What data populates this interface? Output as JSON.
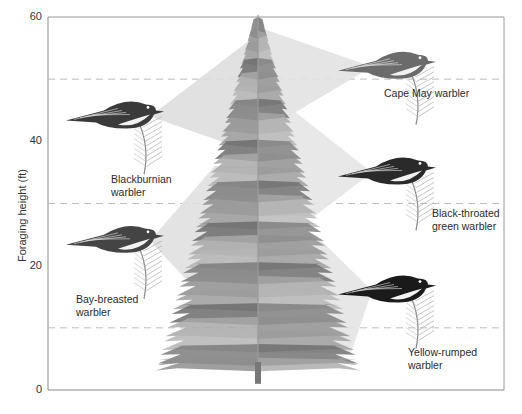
{
  "chart_data": {
    "type": "diagram",
    "title": "",
    "ylabel": "Foraging height (ft)",
    "ylim": [
      0,
      60
    ],
    "yticks": [
      0,
      20,
      40,
      60
    ],
    "gridlines_dashed": [
      10,
      30,
      50
    ],
    "tree": {
      "name": "spruce",
      "base_ft": 1,
      "top_ft": 60
    },
    "species": [
      {
        "name": "Cape May warbler",
        "label": "Cape May warbler",
        "side": "right",
        "bird_height_ft": 52,
        "zone_ft": [
          44,
          58
        ],
        "bird_color": "#6b6b6b"
      },
      {
        "name": "Blackburnian warbler",
        "label": "Blackburnian\nwarbler",
        "side": "left",
        "bird_height_ft": 44,
        "zone_ft": [
          40,
          56
        ],
        "bird_color": "#3a3a3a"
      },
      {
        "name": "Black-throated green warbler",
        "label": "Black-throated\ngreen warbler",
        "side": "right",
        "bird_height_ft": 35,
        "zone_ft": [
          28,
          46
        ],
        "bird_color": "#2a2a2a"
      },
      {
        "name": "Bay-breasted warbler",
        "label": "Bay-breasted\nwarbler",
        "side": "left",
        "bird_height_ft": 24,
        "zone_ft": [
          18,
          36
        ],
        "bird_color": "#444444"
      },
      {
        "name": "Yellow-rumped warbler",
        "label": "Yellow-rumped\nwarbler",
        "side": "right",
        "bird_height_ft": 16,
        "zone_ft": [
          6,
          24
        ],
        "bird_color": "#1a1a1a"
      }
    ]
  }
}
